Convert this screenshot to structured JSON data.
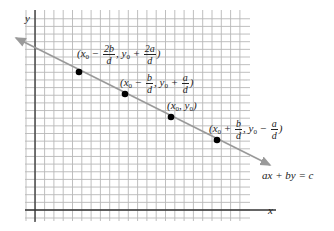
{
  "axes": {
    "x_label": "x",
    "y_label": "y"
  },
  "line": {
    "equation": "ax + by = c",
    "color": "#9a9a9a"
  },
  "grid": {
    "color": "#b5b5b5",
    "axis_color": "#333333"
  },
  "points": [
    {
      "label_prefix": "(x",
      "sub": "0",
      "op1": " − ",
      "num1": "2b",
      "den1": "d",
      "mid": ", y",
      "sub2": "0",
      "op2": " + ",
      "num2": "2a",
      "den2": "d",
      "close": ")"
    },
    {
      "label_prefix": "(x",
      "sub": "0",
      "op1": " − ",
      "num1": "b",
      "den1": "d",
      "mid": ", y",
      "sub2": "0",
      "op2": " + ",
      "num2": "a",
      "den2": "d",
      "close": ")"
    },
    {
      "label_prefix": "(x",
      "sub": "0",
      "mid": ", y",
      "sub2": "0",
      "close": ")"
    },
    {
      "label_prefix": "(x",
      "sub": "0",
      "op1": " + ",
      "num1": "b",
      "den1": "d",
      "mid": ", y",
      "sub2": "0",
      "op2": " − ",
      "num2": "a",
      "den2": "d",
      "close": ")"
    }
  ]
}
